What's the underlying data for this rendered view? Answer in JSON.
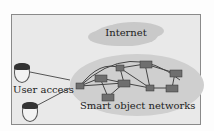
{
  "diagram": {
    "cloud_label": "Internet",
    "network_label": "Smart object networks",
    "user_label": "User access",
    "colors": {
      "frame_bg": "#e9e9e9",
      "cloud": "#c9c9c9",
      "network_ellipse": "#cfcfcf",
      "node": "#6f6f6f",
      "link": "#444444"
    },
    "nodes": 10,
    "users": 2
  }
}
